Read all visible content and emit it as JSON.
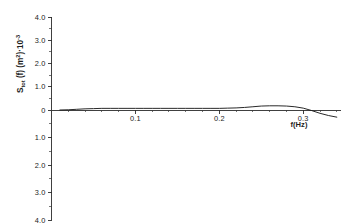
{
  "figure": {
    "background_color": "#ffffff",
    "line_color": "#1d1d1d",
    "axis_color": "#2b2b2b"
  },
  "axes": {
    "y_label_main": "S",
    "y_label_sub": "tot",
    "y_label_mid": " (f) (m",
    "y_label_sup1": "2",
    "y_label_mid2": ")·10",
    "y_label_sup2": "-3",
    "x_label": "f(Hz)"
  },
  "chart_data": {
    "type": "line",
    "title": "",
    "xlabel": "f(Hz)",
    "ylabel": "S_tot (f) (m^2)·10^-3",
    "xlim": [
      0.0,
      0.345
    ],
    "ylim": [
      -4.0,
      4.0
    ],
    "grid": false,
    "legend": null,
    "x_ticks": [
      0.1,
      0.2,
      0.3
    ],
    "x_tick_labels": [
      "0.1",
      "0.2",
      "0.3"
    ],
    "x_minor_tick_step": 0.02,
    "y_ticks": [
      4.0,
      3.0,
      2.0,
      1.0,
      0.0,
      -1.0,
      -2.0,
      -3.0,
      -4.0
    ],
    "y_tick_labels": [
      "4.0",
      "3.0",
      "2.0",
      "1.0",
      "0",
      "1.0",
      "2.0",
      "3.0",
      "4.0"
    ],
    "series": [
      {
        "name": "S_tot(f)",
        "color": "#1d1d1d",
        "x": [
          0.01,
          0.02,
          0.03,
          0.04,
          0.05,
          0.06,
          0.07,
          0.08,
          0.09,
          0.1,
          0.11,
          0.12,
          0.13,
          0.14,
          0.15,
          0.16,
          0.17,
          0.18,
          0.19,
          0.2,
          0.21,
          0.22,
          0.23,
          0.24,
          0.25,
          0.26,
          0.27,
          0.28,
          0.29,
          0.3,
          0.31,
          0.32,
          0.33,
          0.34
        ],
        "y": [
          0.0,
          0.01,
          0.03,
          0.05,
          0.06,
          0.07,
          0.07,
          0.07,
          0.07,
          0.07,
          0.07,
          0.07,
          0.07,
          0.07,
          0.07,
          0.07,
          0.07,
          0.07,
          0.07,
          0.07,
          0.08,
          0.09,
          0.11,
          0.14,
          0.17,
          0.18,
          0.18,
          0.17,
          0.14,
          0.08,
          -0.02,
          -0.12,
          -0.2,
          -0.26
        ]
      }
    ]
  }
}
